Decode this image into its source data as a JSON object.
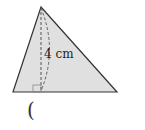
{
  "diagram": {
    "type": "triangle-with-altitude",
    "height_label": "4 cm",
    "answer_bracket": "(",
    "colors": {
      "fill": "#e0e0e0",
      "stroke": "#333333",
      "dashed": "#555555"
    }
  }
}
